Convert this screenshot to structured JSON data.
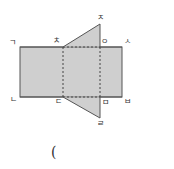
{
  "diagram": {
    "colors": {
      "fill": "#cfcfcf",
      "stroke": "#555555",
      "dash": "#444444"
    },
    "labels": {
      "top_left": "ㄱ",
      "bottom_left": "ㄴ",
      "bottom_mid_left": "ㄷ",
      "bottom_apex": "ㄹ",
      "bottom_mid_right": "ㅁ",
      "bottom_right": "ㅂ",
      "top_right": "ㅅ",
      "top_mid_right": "ㅇ",
      "top_apex": "ㅈ",
      "top_mid_left": "ㅊ"
    },
    "answer_paren": "("
  }
}
